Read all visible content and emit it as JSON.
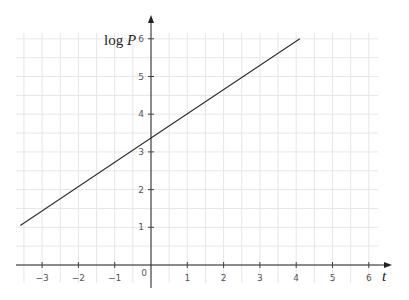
{
  "chart_data": {
    "type": "line",
    "title": "",
    "xlabel": "t",
    "ylabel": "log P",
    "xlim": [
      -3.7,
      6.3
    ],
    "ylim": [
      -0.6,
      6.3
    ],
    "x_ticks": [
      -3,
      -2,
      -1,
      0,
      1,
      2,
      3,
      4,
      5,
      6
    ],
    "y_ticks": [
      1,
      2,
      3,
      4,
      5,
      6
    ],
    "x_tick_labels": [
      "−3",
      "−2",
      "−1",
      "0",
      "1",
      "2",
      "3",
      "4",
      "5",
      "6"
    ],
    "y_tick_labels": [
      "1",
      "2",
      "3",
      "4",
      "5",
      "6"
    ],
    "grid": true,
    "grid_minor_step": 0.5,
    "legend": null,
    "series": [
      {
        "name": "log P vs t",
        "color": "#333333",
        "x": [
          -3.6,
          0,
          4.1
        ],
        "y": [
          1.05,
          3.37,
          6.0
        ]
      }
    ],
    "equation_estimate": "log P ≈ 0.64 t + 3.37"
  },
  "labels": {
    "y_axis": "log ",
    "y_axis_var": "P",
    "x_axis": "t",
    "origin": "0"
  },
  "colors": {
    "grid": "#e6e6e6",
    "axis": "#222222",
    "line": "#333333",
    "tick_text": "#555555"
  }
}
